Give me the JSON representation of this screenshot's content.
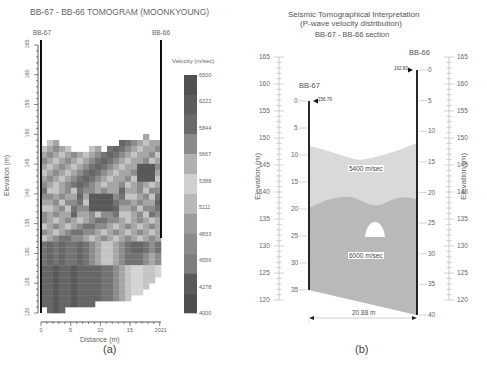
{
  "panel_a": {
    "title": "BB-67 - BB-66 TOMOGRAM (MOONKYOUNG)",
    "left_borehole": "BB-67",
    "right_borehole": "BB-66",
    "ylabel": "Elevation (m)",
    "xlabel": "Distance (m)",
    "yticks": [
      "165",
      "160",
      "155",
      "150",
      "145",
      "140",
      "135",
      "130",
      "125",
      "120"
    ],
    "xticks": [
      "0",
      "5",
      "10",
      "15",
      "2021"
    ],
    "colorbar_title": "Velocity (m/sec)",
    "colorbar_labels": [
      "6500",
      "6222",
      "5844",
      "5667",
      "5388",
      "5111",
      "4833",
      "4556",
      "4278",
      "4000"
    ],
    "caption": "(a)"
  },
  "panel_b": {
    "title_line1": "Seismic Tomographical Interpretation",
    "title_line2": "(P-wave velocity distribution)",
    "title_line3": "BB-67 - BB-66 section",
    "left_borehole": "BB-67",
    "right_borehole": "BB-66",
    "left_collar": "156.79",
    "right_collar": "162.83",
    "ylabel": "Elevation (m)",
    "elev_ticks": [
      "165",
      "160",
      "155",
      "150",
      "145",
      "140",
      "135",
      "130",
      "125",
      "120"
    ],
    "left_depth_ticks": [
      "0",
      "5",
      "10",
      "15",
      "20",
      "25",
      "30",
      "35"
    ],
    "right_depth_ticks": [
      "0",
      "5",
      "10",
      "15",
      "20",
      "25",
      "30",
      "35",
      "40"
    ],
    "upper_layer_label": "5400 m/sec",
    "lower_layer_label": "6000 m/sec",
    "distance_label": "20.88 m",
    "caption": "(b)"
  },
  "chart_data": [
    {
      "type": "heatmap",
      "title": "BB-67 - BB-66 TOMOGRAM (MOONKYOUNG)",
      "xlabel": "Distance (m)",
      "ylabel": "Elevation (m)",
      "xlim": [
        0,
        20.21
      ],
      "ylim": [
        120,
        165
      ],
      "colorbar": {
        "label": "Velocity (m/sec)",
        "range": [
          4000,
          6500
        ],
        "ticks": [
          6500,
          6222,
          5844,
          5667,
          5388,
          5111,
          4833,
          4556,
          4278,
          4000
        ]
      },
      "note": "Tomogram cells cover ~121-150 m elevation; higher velocity (darker) zones at depth and near 143-145 m."
    },
    {
      "type": "diagram",
      "title": "Seismic Tomographical Interpretation (P-wave velocity distribution) BB-67 - BB-66 section",
      "boreholes": [
        {
          "name": "BB-67",
          "collar_elevation": 156.79,
          "max_depth": 35
        },
        {
          "name": "BB-66",
          "collar_elevation": 162.83,
          "max_depth": 40
        }
      ],
      "layers": [
        {
          "label": "5400 m/sec",
          "velocity": 5400
        },
        {
          "label": "6000 m/sec",
          "velocity": 6000
        }
      ],
      "distance": "20.88 m",
      "ylim": [
        120,
        165
      ]
    }
  ]
}
